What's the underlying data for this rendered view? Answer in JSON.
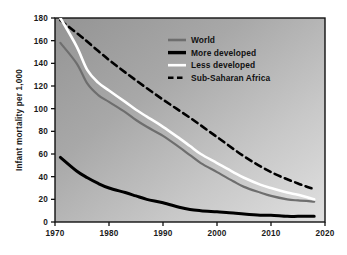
{
  "chart_data": {
    "type": "line",
    "title": "",
    "subtitle": "",
    "xlabel": "",
    "ylabel": "Infant mortality per 1,000",
    "xlim": [
      1970,
      2020
    ],
    "ylim": [
      0,
      180
    ],
    "xticks": [
      "1970",
      "1980",
      "1990",
      "2000",
      "2010",
      "2020"
    ],
    "xtick_values": [
      1970,
      1980,
      1990,
      2000,
      2010,
      2020
    ],
    "yticks": [
      "0",
      "20",
      "40",
      "60",
      "80",
      "100",
      "120",
      "140",
      "160",
      "180"
    ],
    "ytick_values": [
      0,
      20,
      40,
      60,
      80,
      100,
      120,
      140,
      160,
      180
    ],
    "grid": false,
    "legend_position": "top-center-right",
    "series": [
      {
        "name": "World",
        "color": "#6e6e6e",
        "style": "solid",
        "width": 2.2,
        "x": [
          1971,
          1974,
          1976,
          1978,
          1980,
          1983,
          1985,
          1987,
          1990,
          1993,
          1995,
          1997,
          2000,
          2003,
          2005,
          2008,
          2010,
          2013,
          2015,
          2018
        ],
        "y": [
          158,
          140,
          122,
          112,
          106,
          97,
          90,
          84,
          76,
          66,
          59,
          52,
          44,
          36,
          31,
          26,
          23,
          20,
          19,
          18
        ]
      },
      {
        "name": "More developed",
        "color": "#000000",
        "style": "solid",
        "width": 3.0,
        "x": [
          1971,
          1974,
          1976,
          1978,
          1980,
          1983,
          1985,
          1987,
          1990,
          1993,
          1995,
          1997,
          2000,
          2003,
          2005,
          2008,
          2010,
          2013,
          2015,
          2018
        ],
        "y": [
          57,
          45,
          39,
          34,
          30,
          26,
          23,
          20,
          17,
          13,
          11,
          10,
          9,
          8,
          7,
          6,
          6,
          5,
          5,
          5
        ]
      },
      {
        "name": "Less developed",
        "color": "#ffffff",
        "style": "solid",
        "width": 2.6,
        "x": [
          1971,
          1974,
          1976,
          1978,
          1980,
          1983,
          1985,
          1987,
          1990,
          1993,
          1995,
          1997,
          2000,
          2003,
          2005,
          2008,
          2010,
          2013,
          2015,
          2018
        ],
        "y": [
          180,
          155,
          134,
          123,
          116,
          106,
          99,
          93,
          84,
          74,
          67,
          60,
          52,
          44,
          39,
          33,
          30,
          26,
          24,
          20
        ]
      },
      {
        "name": "Sub-Saharan Africa",
        "color": "#000000",
        "style": "dashed",
        "width": 2.6,
        "x": [
          1971,
          1975,
          1980,
          1985,
          1990,
          1995,
          2000,
          2005,
          2010,
          2015,
          2018
        ],
        "y": [
          178,
          163,
          143,
          125,
          108,
          92,
          75,
          58,
          44,
          34,
          29
        ]
      }
    ]
  },
  "legend": {
    "items": [
      {
        "label": "World",
        "swatch": "legend-swatch-world"
      },
      {
        "label": "More developed",
        "swatch": "legend-swatch-more-developed"
      },
      {
        "label": "Less developed",
        "swatch": "legend-swatch-less-developed"
      },
      {
        "label": "Sub-Saharan Africa",
        "swatch": "legend-swatch-sub-saharan-africa"
      }
    ]
  },
  "axes": {
    "y_title": "Infant mortality per 1,000",
    "y_labels": [
      "180",
      "160",
      "140",
      "120",
      "100",
      "80",
      "60",
      "40",
      "20",
      "0"
    ],
    "x_labels": [
      "1970",
      "1980",
      "1990",
      "2000",
      "2010",
      "2020"
    ]
  },
  "colors": {
    "world": "#6e6e6e",
    "more_developed": "#000000",
    "less_developed": "#ffffff",
    "sub_saharan_africa": "#000000",
    "plot_bg_dark": "#9a9a9a",
    "plot_bg_light": "#dadada",
    "frame": "#111111",
    "page_bg": "#ffffff"
  }
}
